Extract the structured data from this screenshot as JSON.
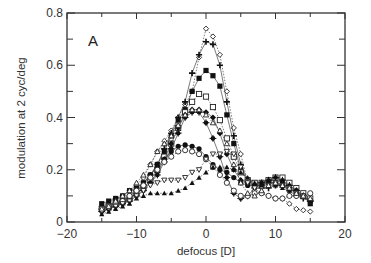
{
  "chart_data": {
    "type": "line",
    "title": "",
    "panel_label": "A",
    "xlabel": "defocus [D]",
    "ylabel": "modulation at 2 cyc/deg",
    "xlim": [
      -20,
      20
    ],
    "ylim": [
      0,
      0.8
    ],
    "xticks": [
      -20,
      -10,
      0,
      10,
      20
    ],
    "xtick_labels": [
      "−20",
      "−10",
      "0",
      "10",
      "20"
    ],
    "yticks": [
      0,
      0.2,
      0.4,
      0.6,
      0.8
    ],
    "ytick_labels": [
      "0",
      "0.2",
      "0.4",
      "0.6",
      "0.8"
    ],
    "grid": false,
    "legend": "none",
    "x": [
      -15,
      -14,
      -13,
      -12,
      -11,
      -10,
      -9,
      -8,
      -7,
      -6,
      -5,
      -4,
      -3,
      -2,
      -1,
      0,
      1,
      2,
      3,
      4,
      5,
      6,
      7,
      8,
      9,
      10,
      11,
      12,
      13,
      14,
      15
    ],
    "series": [
      {
        "name": "open diamond",
        "marker": "diamond-open",
        "line": "dotted",
        "values": [
          0.06,
          0.07,
          0.09,
          0.1,
          0.12,
          0.14,
          0.17,
          0.22,
          0.27,
          0.31,
          0.35,
          0.4,
          0.45,
          0.5,
          0.63,
          0.74,
          0.71,
          0.64,
          0.5,
          0.36,
          0.26,
          0.15,
          0.12,
          0.11,
          0.1,
          0.09,
          0.09,
          0.07,
          0.05,
          0.045,
          0.04
        ]
      },
      {
        "name": "plus",
        "marker": "plus",
        "line": "solid",
        "values": [
          0.05,
          0.06,
          0.07,
          0.08,
          0.09,
          0.12,
          0.14,
          0.18,
          0.22,
          0.28,
          0.34,
          0.4,
          0.46,
          0.57,
          0.64,
          0.69,
          0.68,
          0.6,
          0.46,
          0.33,
          0.22,
          0.16,
          0.14,
          0.13,
          0.13,
          0.14,
          0.14,
          0.12,
          0.1,
          0.09,
          0.08
        ]
      },
      {
        "name": "filled square",
        "marker": "square-filled",
        "line": "solid",
        "values": [
          0.07,
          0.08,
          0.09,
          0.1,
          0.12,
          0.13,
          0.15,
          0.18,
          0.22,
          0.27,
          0.33,
          0.39,
          0.43,
          0.5,
          0.55,
          0.58,
          0.56,
          0.52,
          0.41,
          0.3,
          0.2,
          0.16,
          0.15,
          0.15,
          0.16,
          0.16,
          0.15,
          0.14,
          0.12,
          0.1,
          0.07
        ]
      },
      {
        "name": "open square",
        "marker": "square-open",
        "line": "dotted",
        "values": [
          0.05,
          0.06,
          0.07,
          0.08,
          0.09,
          0.11,
          0.13,
          0.16,
          0.2,
          0.25,
          0.3,
          0.36,
          0.42,
          0.46,
          0.49,
          0.48,
          0.44,
          0.39,
          0.32,
          0.25,
          0.19,
          0.16,
          0.15,
          0.15,
          0.16,
          0.17,
          0.17,
          0.15,
          0.13,
          0.11,
          0.09
        ]
      },
      {
        "name": "filled diamond",
        "marker": "diamond-filled",
        "line": "solid",
        "values": [
          0.04,
          0.05,
          0.06,
          0.07,
          0.09,
          0.11,
          0.13,
          0.15,
          0.19,
          0.24,
          0.3,
          0.36,
          0.41,
          0.43,
          0.43,
          0.42,
          0.4,
          0.34,
          0.26,
          0.2,
          0.16,
          0.15,
          0.14,
          0.14,
          0.15,
          0.15,
          0.14,
          0.13,
          0.11,
          0.1,
          0.08
        ]
      },
      {
        "name": "filled circle cross",
        "marker": "circle-cross",
        "line": "solid",
        "values": [
          0.04,
          0.05,
          0.06,
          0.07,
          0.08,
          0.1,
          0.12,
          0.15,
          0.18,
          0.23,
          0.28,
          0.34,
          0.4,
          0.42,
          0.42,
          0.38,
          0.32,
          0.25,
          0.17,
          0.11,
          0.09,
          0.1,
          0.13,
          0.15,
          0.16,
          0.17,
          0.16,
          0.14,
          0.12,
          0.1,
          0.08
        ]
      },
      {
        "name": "filled circle",
        "marker": "circle-filled",
        "line": "solid",
        "values": [
          0.05,
          0.06,
          0.07,
          0.08,
          0.1,
          0.12,
          0.15,
          0.18,
          0.21,
          0.24,
          0.27,
          0.29,
          0.295,
          0.29,
          0.28,
          0.25,
          0.22,
          0.2,
          0.19,
          0.17,
          0.15,
          0.14,
          0.14,
          0.14,
          0.15,
          0.15,
          0.14,
          0.13,
          0.12,
          0.1,
          0.08
        ]
      },
      {
        "name": "open circle",
        "marker": "circle-open",
        "line": "dotted",
        "values": [
          0.05,
          0.06,
          0.07,
          0.08,
          0.1,
          0.12,
          0.14,
          0.17,
          0.2,
          0.23,
          0.25,
          0.27,
          0.275,
          0.27,
          0.26,
          0.24,
          0.21,
          0.18,
          0.15,
          0.12,
          0.1,
          0.1,
          0.11,
          0.11,
          0.1,
          0.09,
          0.09,
          0.1,
          0.1,
          0.1,
          0.11
        ]
      },
      {
        "name": "open down triangle",
        "marker": "triangle-down-open",
        "line": "dotted",
        "values": [
          0.04,
          0.05,
          0.06,
          0.07,
          0.08,
          0.1,
          0.12,
          0.14,
          0.15,
          0.16,
          0.16,
          0.16,
          0.17,
          0.19,
          0.2,
          0.24,
          0.26,
          0.26,
          0.27,
          0.26,
          0.21,
          0.15,
          0.13,
          0.13,
          0.14,
          0.15,
          0.14,
          0.13,
          0.11,
          0.1,
          0.08
        ]
      },
      {
        "name": "filled triangle",
        "marker": "triangle-filled",
        "line": "dotted",
        "values": [
          0.03,
          0.04,
          0.05,
          0.06,
          0.07,
          0.09,
          0.1,
          0.11,
          0.11,
          0.11,
          0.11,
          0.12,
          0.13,
          0.15,
          0.17,
          0.19,
          0.21,
          0.21,
          0.21,
          0.2,
          0.19,
          0.17,
          0.15,
          0.14,
          0.14,
          0.14,
          0.13,
          0.12,
          0.11,
          0.1,
          0.08
        ]
      },
      {
        "name": "open triangle",
        "marker": "triangle-open",
        "line": "dotted",
        "values": [
          0.05,
          0.06,
          0.08,
          0.1,
          0.12,
          0.15,
          0.18,
          0.22,
          0.27,
          0.3,
          0.33,
          0.37,
          0.41,
          0.43,
          0.43,
          0.41,
          0.38,
          0.35,
          0.3,
          0.22,
          0.15,
          0.11,
          0.1,
          0.12,
          0.14,
          0.15,
          0.14,
          0.13,
          0.11,
          0.1,
          0.09
        ]
      }
    ]
  }
}
